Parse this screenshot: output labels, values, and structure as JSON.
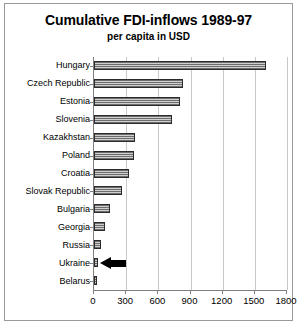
{
  "chart_data": {
    "type": "bar",
    "orientation": "horizontal",
    "title": "Cumulative FDI-inflows 1989-97",
    "subtitle": "per capita in USD",
    "xlabel": "",
    "ylabel": "",
    "xlim": [
      0,
      1800
    ],
    "xticks": [
      0,
      300,
      600,
      900,
      1200,
      1500,
      1800
    ],
    "grid": true,
    "legend": false,
    "categories": [
      "Hungary",
      "Czech Republic",
      "Estonia",
      "Slovenia",
      "Kazakhstan",
      "Poland",
      "Croatia",
      "Slovak Republic",
      "Bulgaria",
      "Georgia",
      "Russia",
      "Ukraine",
      "Belarus"
    ],
    "values": [
      1600,
      830,
      800,
      730,
      380,
      370,
      330,
      265,
      150,
      100,
      65,
      40,
      25
    ],
    "annotations": [
      {
        "name": "ukraine-arrow",
        "icon": "left-arrow-icon",
        "points_at": "Ukraine"
      }
    ]
  },
  "axis": {
    "tick_labels": [
      "0",
      "300",
      "600",
      "900",
      "1200",
      "1500",
      "1800"
    ]
  }
}
